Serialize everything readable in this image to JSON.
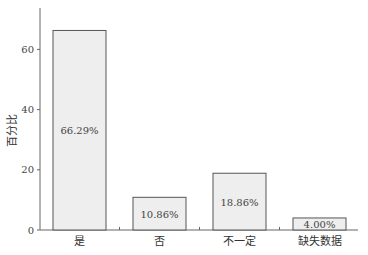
{
  "chart_data": {
    "type": "bar",
    "title": "",
    "xlabel": "",
    "ylabel": "百分比",
    "categories": [
      "是",
      "否",
      "不一定",
      "缺失数据"
    ],
    "values": [
      66.29,
      10.86,
      18.86,
      4.0
    ],
    "value_labels": [
      "66.29%",
      "10.86%",
      "18.86%",
      "4.00%"
    ],
    "yticks": [
      0,
      20,
      40,
      60
    ],
    "ylim": [
      0,
      73
    ],
    "grid": false,
    "legend": null,
    "bar_fill": "#eeeeee",
    "bar_stroke": "#555555"
  }
}
